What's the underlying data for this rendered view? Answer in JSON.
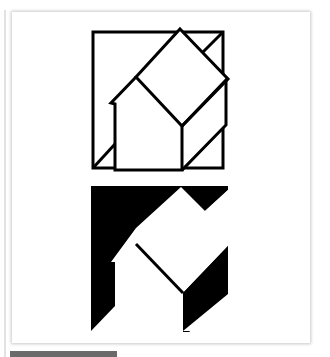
{
  "figure": {
    "colors": {
      "ink": "#000000",
      "paper": "#ffffff",
      "frame_shadow": "#c8c8c8",
      "bottom_bar": "#6a6a6a"
    },
    "top_puzzle": {
      "label": "outline"
    },
    "bottom_puzzle": {
      "label": "silhouette"
    }
  }
}
